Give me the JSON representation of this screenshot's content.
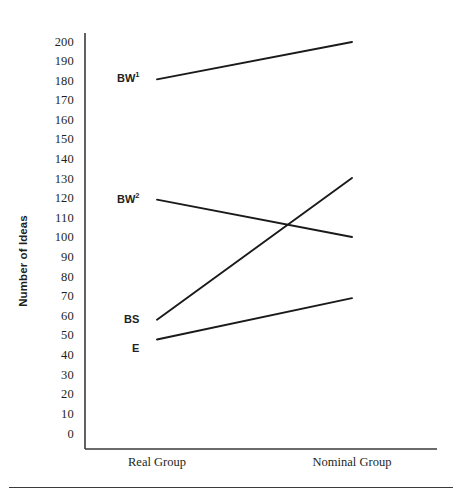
{
  "chart_data": {
    "type": "line",
    "title": "",
    "xlabel": "",
    "ylabel": "Number of Ideas",
    "categories": [
      "Real Group",
      "Nominal Group"
    ],
    "ylim": [
      0,
      200
    ],
    "ytick_step": 10,
    "yticks": [
      "200",
      "190",
      "180",
      "170",
      "160",
      "150",
      "140",
      "130",
      "120",
      "110",
      "100",
      "90",
      "80",
      "70",
      "60",
      "50",
      "40",
      "30",
      "20",
      "10",
      "0"
    ],
    "grid": false,
    "legend": "inline-left-labels",
    "line_color": "#1a1a1a",
    "axis_color": "#3a3a3a",
    "series": [
      {
        "name": "BW1",
        "label": "BW",
        "superscript": "1",
        "values": [
          181,
          200
        ]
      },
      {
        "name": "BW2",
        "label": "BW",
        "superscript": "2",
        "values": [
          120,
          101
        ]
      },
      {
        "name": "BS",
        "label": "BS",
        "superscript": "",
        "values": [
          59,
          131
        ]
      },
      {
        "name": "E",
        "label": "E",
        "superscript": "",
        "values": [
          49,
          70
        ]
      }
    ]
  },
  "axis": {
    "y_title": "Number of Ideas",
    "tick_200": "200",
    "tick_190": "190",
    "tick_180": "180",
    "tick_170": "170",
    "tick_160": "160",
    "tick_150": "150",
    "tick_140": "140",
    "tick_130": "130",
    "tick_120": "120",
    "tick_110": "110",
    "tick_100": "100",
    "tick_90": "90",
    "tick_80": "80",
    "tick_70": "70",
    "tick_60": "60",
    "tick_50": "50",
    "tick_40": "40",
    "tick_30": "30",
    "tick_20": "20",
    "tick_10": "10",
    "tick_0": "0",
    "x_cat_1": "Real Group",
    "x_cat_2": "Nominal Group"
  },
  "labels": {
    "bw1_text": "BW",
    "bw1_sup": "1",
    "bw2_text": "BW",
    "bw2_sup": "2",
    "bs_text": "BS",
    "e_text": "E"
  }
}
